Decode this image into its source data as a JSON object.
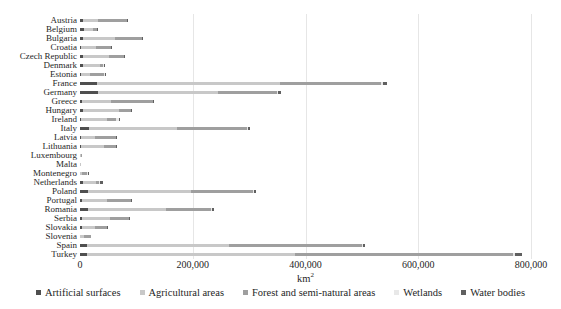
{
  "chart_data": {
    "type": "bar",
    "orientation": "horizontal",
    "stacked": true,
    "title": "",
    "xlabel": {
      "base": "km",
      "sup": "2"
    },
    "ylabel": "",
    "xlim": [
      0,
      800000
    ],
    "xticks": [
      0,
      200000,
      400000,
      600000,
      800000
    ],
    "xtick_labels": [
      "0",
      "200,000",
      "400,000",
      "600,000",
      "800,000"
    ],
    "grid": "vertical",
    "legend_position": "bottom",
    "categories": [
      "Austria",
      "Belgium",
      "Bulgaria",
      "Croatia",
      "Czech Republic",
      "Denmark",
      "Estonia",
      "France",
      "Germany",
      "Greece",
      "Hungary",
      "Ireland",
      "Italy",
      "Latvia",
      "Lithuania",
      "Luxembourg",
      "Malta",
      "Montenegro",
      "Netherlands",
      "Poland",
      "Portugal",
      "Romania",
      "Serbia",
      "Slovakia",
      "Slovenia",
      "Spain",
      "Turkey"
    ],
    "series": [
      {
        "name": "Artificial surfaces",
        "color": "#4f4f4f",
        "values": [
          4600,
          6400,
          5600,
          2300,
          5300,
          4500,
          1500,
          30600,
          32800,
          4100,
          5800,
          2000,
          15800,
          1400,
          2200,
          260,
          70,
          300,
          5800,
          13500,
          3900,
          14600,
          3100,
          2900,
          600,
          11600,
          12800
        ]
      },
      {
        "name": "Agricultural areas",
        "color": "#c8c8c8",
        "values": [
          27400,
          16700,
          57200,
          26900,
          45700,
          31000,
          16100,
          324400,
          211900,
          51600,
          63100,
          46700,
          155900,
          25000,
          40400,
          1320,
          150,
          2600,
          23200,
          183800,
          43900,
          137400,
          50300,
          23900,
          7100,
          252400,
          368900
        ]
      },
      {
        "name": "Forest and semi-natural areas",
        "color": "#9f9f9f",
        "values": [
          50600,
          7000,
          47300,
          26000,
          27200,
          6000,
          24800,
          179200,
          104600,
          73500,
          21300,
          15700,
          124800,
          36700,
          21100,
          1000,
          90,
          10400,
          5200,
          109800,
          42500,
          79700,
          34100,
          21600,
          12400,
          236900,
          386500
        ]
      },
      {
        "name": "Wetlands",
        "color": "#e8e8e8",
        "values": [
          200,
          90,
          250,
          400,
          100,
          700,
          1700,
          3300,
          1700,
          600,
          1100,
          4100,
          900,
          1100,
          500,
          5,
          2,
          100,
          1100,
          1100,
          300,
          1700,
          200,
          100,
          50,
          1000,
          2700
        ]
      },
      {
        "name": "Water bodies",
        "color": "#606060",
        "values": [
          1100,
          300,
          700,
          1000,
          600,
          700,
          1600,
          6400,
          6200,
          2200,
          1700,
          1800,
          4000,
          1400,
          1100,
          10,
          4,
          400,
          6200,
          4500,
          1600,
          5000,
          700,
          500,
          120,
          4100,
          12700
        ]
      }
    ],
    "colors": {
      "background": "#ffffff",
      "gridline": "#e6e6e6",
      "text": "#262626"
    }
  }
}
